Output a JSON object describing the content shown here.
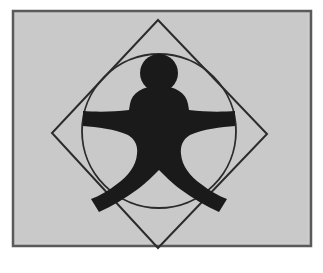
{
  "artwork": {
    "title": "Vitruvian Figure Emblem",
    "description": "Black stylized human figure with round head, outstretched arms and splayed legs, inscribed in a circle outline which is inscribed in a rotated square (diamond) outline, on a light gray panel with a dark border.",
    "canvas": {
      "width": 323,
      "height": 273,
      "background": "#ffffff"
    },
    "panel": {
      "name": "gray-panel",
      "x": 13,
      "y": 11,
      "width": 298,
      "height": 235,
      "fill": "#c9c9c9",
      "stroke": "#5a5a5a",
      "stroke_width": 2.5
    },
    "diamond": {
      "name": "rotated-square-outline",
      "points": "158,20 267,134 158,248 52,133",
      "stroke": "#2b2b2b",
      "stroke_width": 2,
      "fill": "none"
    },
    "circle": {
      "name": "inscribed-circle-outline",
      "cx": 159,
      "cy": 131,
      "r": 77,
      "stroke": "#2b2b2b",
      "stroke_width": 1.8,
      "fill": "none"
    },
    "figure": {
      "name": "human-figure",
      "fill": "#1a1a1a",
      "head": {
        "cx": 159,
        "cy": 73,
        "r": 19
      },
      "body_path": "M 159,86 C 176,86 186,93 188,104 L 189,110 C 205,112 222,112 235,111 L 235,126 C 221,127 203,129 190,135 C 183,139 180,146 181,154 C 182,166 190,176 201,184 C 210,191 219,196 227,199 L 219,212 C 206,206 192,198 180,189 C 171,182 165,176 159,170 C 153,176 147,182 138,189 C 126,198 112,206 99,212 L 91,199 C 99,196 108,191 117,184 C 128,176 136,166 137,154 C 138,146 135,139 128,135 C 115,129 97,127 83,126 L 83,111 C 96,112 113,112 129,110 L 130,104 C 132,93 142,86 159,86 Z"
    }
  }
}
